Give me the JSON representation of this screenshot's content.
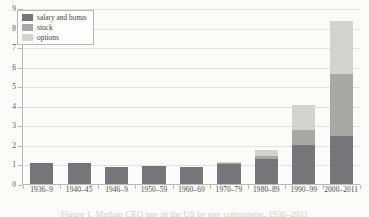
{
  "chart_data": {
    "type": "bar",
    "title": "",
    "subtitle": "",
    "xlabel": "",
    "ylabel": "",
    "stacked": true,
    "grid": true,
    "legend_position": "top-left",
    "ylim": [
      0,
      9
    ],
    "yticks": [
      0,
      1,
      2,
      3,
      4,
      5,
      6,
      7,
      8,
      9
    ],
    "ytick_labels": [
      "0",
      "1",
      "2",
      "3",
      "4",
      "5",
      "6",
      "7",
      "8",
      "9"
    ],
    "categories": [
      "1936–9",
      "1940–45",
      "1946–9",
      "1950–59",
      "1960–69",
      "1970–79",
      "1980–89",
      "1990–99",
      "2000–2011"
    ],
    "series": [
      {
        "name": "salary and bonus",
        "color": "#76767a",
        "values": [
          1.05,
          1.05,
          0.85,
          0.9,
          0.85,
          1.0,
          1.27,
          2.0,
          2.45
        ]
      },
      {
        "name": "stock",
        "color": "#a8a8a6",
        "values": [
          0.0,
          0.0,
          0.0,
          0.0,
          0.0,
          0.05,
          0.18,
          0.75,
          3.2
        ]
      },
      {
        "name": "options",
        "color": "#d3d3cf",
        "values": [
          0.0,
          0.0,
          0.0,
          0.0,
          0.0,
          0.08,
          0.3,
          1.3,
          2.7
        ]
      }
    ],
    "totals": [
      1.05,
      1.05,
      0.85,
      0.9,
      0.85,
      1.13,
      1.75,
      4.05,
      8.35
    ]
  },
  "legend": {
    "items": [
      {
        "label": "salary and bonus",
        "color": "#76767a"
      },
      {
        "label": "stock",
        "color": "#a8a8a6"
      },
      {
        "label": "options",
        "color": "#d3d3cf"
      }
    ]
  },
  "caption": {
    "text": "Figure 1. Median CEO pay in the US by pay component, 1936–2011"
  },
  "colors": {
    "background": "#fbfbf9",
    "axis": "#b9b9b4",
    "grid": "#e2e2dd",
    "text": "#4a4a4d"
  }
}
